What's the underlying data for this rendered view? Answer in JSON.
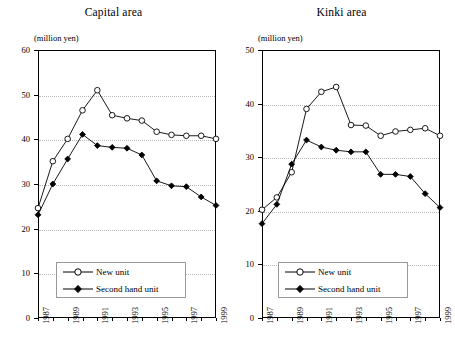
{
  "figure": {
    "unit_label": "(million yen)",
    "background_color": "#ffffff",
    "line_color": "#000000",
    "grid_color": "#b9b9b9"
  },
  "legend": {
    "new_unit_label": "New unit",
    "second_hand_label": "Second hand unit",
    "new_unit_marker": "open-circle-marker",
    "second_hand_marker": "filled-diamond-marker"
  },
  "chart_data": [
    {
      "type": "line",
      "title": "Capital area",
      "xlabel": "",
      "ylabel": "(million yen)",
      "ylim": [
        0,
        60
      ],
      "yticks": [
        0,
        10,
        20,
        30,
        40,
        50,
        60
      ],
      "grid": true,
      "legend_position": "lower-left-inside",
      "x": [
        1987,
        1988,
        1989,
        1990,
        1991,
        1992,
        1993,
        1994,
        1995,
        1996,
        1997,
        1998,
        1999
      ],
      "xtick_labels": [
        "1987",
        "1989",
        "1991",
        "1993",
        "1995",
        "1997",
        "1999"
      ],
      "xtick_values": [
        1987,
        1989,
        1991,
        1993,
        1995,
        1997,
        1999
      ],
      "series": [
        {
          "name": "New unit",
          "marker": "open-circle",
          "values": [
            24.6,
            35.1,
            40.1,
            46.5,
            51.0,
            45.4,
            44.7,
            44.2,
            41.7,
            41.0,
            40.8,
            40.8,
            40.1
          ]
        },
        {
          "name": "Second hand unit",
          "marker": "filled-diamond",
          "values": [
            23.1,
            30.0,
            35.6,
            41.1,
            38.6,
            38.2,
            38.0,
            36.5,
            30.7,
            29.6,
            29.4,
            27.1,
            25.2
          ]
        }
      ]
    },
    {
      "type": "line",
      "title": "Kinki area",
      "xlabel": "",
      "ylabel": "(million yen)",
      "ylim": [
        0,
        50
      ],
      "yticks": [
        0,
        10,
        20,
        30,
        40,
        50
      ],
      "grid": true,
      "legend_position": "lower-left-inside",
      "x": [
        1987,
        1988,
        1989,
        1990,
        1991,
        1992,
        1993,
        1994,
        1995,
        1996,
        1997,
        1998,
        1999
      ],
      "xtick_labels": [
        "1987",
        "1989",
        "1991",
        "1993",
        "1995",
        "1997",
        "1999"
      ],
      "xtick_values": [
        1987,
        1989,
        1991,
        1993,
        1995,
        1997,
        1999
      ],
      "series": [
        {
          "name": "New unit",
          "marker": "open-circle",
          "values": [
            20.2,
            22.5,
            27.2,
            39.0,
            42.2,
            43.1,
            36.0,
            35.9,
            34.0,
            34.8,
            35.1,
            35.4,
            34.0
          ]
        },
        {
          "name": "Second hand unit",
          "marker": "filled-diamond",
          "values": [
            17.6,
            21.2,
            28.7,
            33.2,
            31.9,
            31.3,
            31.0,
            31.0,
            26.8,
            26.8,
            26.4,
            23.2,
            20.6
          ]
        }
      ]
    }
  ]
}
